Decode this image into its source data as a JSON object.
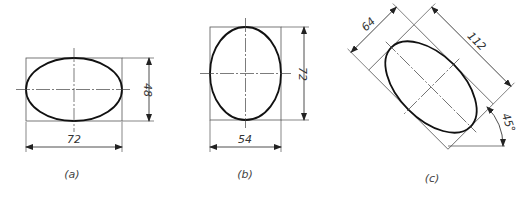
{
  "figures": [
    {
      "id": "a",
      "label": "(a)",
      "width_dim": "72",
      "height_dim": "48"
    },
    {
      "id": "b",
      "label": "(b)",
      "width_dim": "54",
      "height_dim": "72"
    },
    {
      "id": "c",
      "label": "(c)",
      "minor_dim": "64",
      "major_dim": "112",
      "angle": "45°"
    }
  ]
}
